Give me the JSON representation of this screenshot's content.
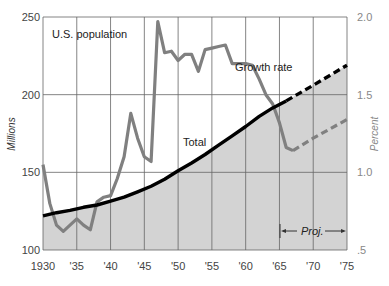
{
  "chart_data": {
    "type": "line",
    "title": "U.S. population",
    "xlabel": "",
    "ylabel": "Millions",
    "ylabel_right": "Percent",
    "xlim": [
      1930,
      1975
    ],
    "ylim": [
      100,
      250
    ],
    "ylim_right": [
      0.5,
      2.0
    ],
    "x_ticks": [
      {
        "value": 1930,
        "label": "1930"
      },
      {
        "value": 1935,
        "label": "'35"
      },
      {
        "value": 1940,
        "label": "'40"
      },
      {
        "value": 1945,
        "label": "'45"
      },
      {
        "value": 1950,
        "label": "'50"
      },
      {
        "value": 1955,
        "label": "'55"
      },
      {
        "value": 1960,
        "label": "'60"
      },
      {
        "value": 1965,
        "label": "'65"
      },
      {
        "value": 1970,
        "label": "'70"
      },
      {
        "value": 1975,
        "label": "'75"
      }
    ],
    "y_ticks": [
      {
        "value": 100,
        "label": "100"
      },
      {
        "value": 150,
        "label": "150"
      },
      {
        "value": 200,
        "label": "200"
      },
      {
        "value": 250,
        "label": "250"
      }
    ],
    "y_ticks_right": [
      {
        "value": 0.5,
        "label": ".5"
      },
      {
        "value": 1.0,
        "label": "1.0"
      },
      {
        "value": 1.5,
        "label": "1.5"
      },
      {
        "value": 2.0,
        "label": "2.0"
      }
    ],
    "grid": true,
    "series": [
      {
        "name": "Total",
        "axis": "left",
        "unit": "Millions",
        "color": "#000000",
        "fill": "#d3d3d3",
        "points": [
          [
            1930,
            122
          ],
          [
            1932,
            124
          ],
          [
            1934,
            125.5
          ],
          [
            1936,
            127.5
          ],
          [
            1938,
            129
          ],
          [
            1940,
            131.5
          ],
          [
            1942,
            134
          ],
          [
            1944,
            137.5
          ],
          [
            1946,
            141
          ],
          [
            1948,
            145.5
          ],
          [
            1950,
            151
          ],
          [
            1952,
            156
          ],
          [
            1954,
            161.5
          ],
          [
            1956,
            167.5
          ],
          [
            1958,
            173.5
          ],
          [
            1960,
            179.5
          ],
          [
            1962,
            186
          ],
          [
            1964,
            191.5
          ],
          [
            1966,
            196
          ]
        ],
        "projection": [
          [
            1966,
            196
          ],
          [
            1970,
            206
          ],
          [
            1975,
            219
          ]
        ]
      },
      {
        "name": "Growth rate",
        "axis": "right",
        "unit": "Percent",
        "color": "#808080",
        "points": [
          [
            1930,
            1.05
          ],
          [
            1931,
            0.8
          ],
          [
            1932,
            0.66
          ],
          [
            1933,
            0.62
          ],
          [
            1934,
            0.66
          ],
          [
            1935,
            0.7
          ],
          [
            1936,
            0.66
          ],
          [
            1937,
            0.63
          ],
          [
            1938,
            0.81
          ],
          [
            1939,
            0.84
          ],
          [
            1940,
            0.85
          ],
          [
            1941,
            0.96
          ],
          [
            1942,
            1.1
          ],
          [
            1943,
            1.38
          ],
          [
            1944,
            1.22
          ],
          [
            1945,
            1.1
          ],
          [
            1946,
            1.07
          ],
          [
            1947,
            1.97
          ],
          [
            1948,
            1.77
          ],
          [
            1949,
            1.78
          ],
          [
            1950,
            1.72
          ],
          [
            1951,
            1.76
          ],
          [
            1952,
            1.76
          ],
          [
            1953,
            1.65
          ],
          [
            1954,
            1.79
          ],
          [
            1955,
            1.8
          ],
          [
            1956,
            1.81
          ],
          [
            1957,
            1.82
          ],
          [
            1958,
            1.7
          ],
          [
            1959,
            1.7
          ],
          [
            1960,
            1.7
          ],
          [
            1961,
            1.69
          ],
          [
            1962,
            1.6
          ],
          [
            1963,
            1.5
          ],
          [
            1964,
            1.44
          ],
          [
            1965,
            1.32
          ],
          [
            1966,
            1.16
          ],
          [
            1967,
            1.14
          ]
        ],
        "projection": [
          [
            1967,
            1.14
          ],
          [
            1970,
            1.22
          ],
          [
            1975,
            1.34
          ]
        ]
      }
    ],
    "annotations": [
      {
        "text": "U.S. population",
        "x": 1933,
        "y": 237
      },
      {
        "text": "Growth rate",
        "x": 1957,
        "y": 1.7
      },
      {
        "text": "Total",
        "x": 1950,
        "y": 176
      },
      {
        "text": "Proj.",
        "x_range": [
          1966,
          1975
        ],
        "y": 0.7
      }
    ],
    "legend": "inline labels"
  },
  "labels": {
    "title": "U.S. population",
    "ylabel": "Millions",
    "ylabel_right": "Percent",
    "growth_label": "Growth rate",
    "total_label": "Total",
    "proj_label": "Proj."
  }
}
